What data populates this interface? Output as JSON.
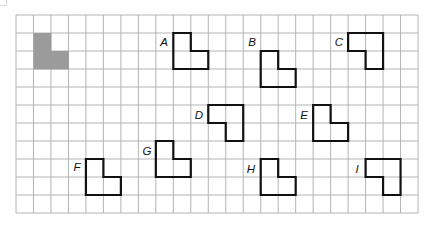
{
  "grid": {
    "origin_x": 16,
    "origin_y": 15,
    "cols": 23,
    "rows": 11,
    "cell_w": 17.48,
    "cell_h": 18,
    "line_color": "#b4b4b4",
    "background": "#ffffff"
  },
  "reference_shape": {
    "name": "shaded-L",
    "fill": "#9b9b9b",
    "cells": [
      [
        1,
        1
      ],
      [
        1,
        2
      ],
      [
        2,
        2
      ]
    ]
  },
  "outline_color": "#111111",
  "shapes": [
    {
      "label": "A",
      "cells": [
        [
          9,
          1
        ],
        [
          9,
          2
        ],
        [
          10,
          2
        ]
      ],
      "label_x": 164,
      "label_y": 46
    },
    {
      "label": "B",
      "cells": [
        [
          14,
          2
        ],
        [
          14,
          3
        ],
        [
          15,
          3
        ]
      ],
      "label_x": 252,
      "label_y": 46
    },
    {
      "label": "C",
      "cells": [
        [
          19,
          1
        ],
        [
          20,
          1
        ],
        [
          20,
          2
        ]
      ],
      "label_x": 339,
      "label_y": 46
    },
    {
      "label": "D",
      "cells": [
        [
          11,
          5
        ],
        [
          12,
          5
        ],
        [
          12,
          6
        ]
      ],
      "label_x": 199,
      "label_y": 119
    },
    {
      "label": "E",
      "cells": [
        [
          17,
          5
        ],
        [
          17,
          6
        ],
        [
          18,
          6
        ]
      ],
      "label_x": 304,
      "label_y": 119
    },
    {
      "label": "F",
      "cells": [
        [
          4,
          8
        ],
        [
          4,
          9
        ],
        [
          5,
          9
        ]
      ],
      "label_x": 77,
      "label_y": 171
    },
    {
      "label": "G",
      "cells": [
        [
          8,
          7
        ],
        [
          8,
          8
        ],
        [
          9,
          8
        ]
      ],
      "label_x": 147,
      "label_y": 155
    },
    {
      "label": "H",
      "cells": [
        [
          14,
          8
        ],
        [
          14,
          9
        ],
        [
          15,
          9
        ]
      ],
      "label_x": 251,
      "label_y": 173
    },
    {
      "label": "I",
      "cells": [
        [
          20,
          8
        ],
        [
          21,
          8
        ],
        [
          21,
          9
        ]
      ],
      "label_x": 357,
      "label_y": 173
    }
  ]
}
